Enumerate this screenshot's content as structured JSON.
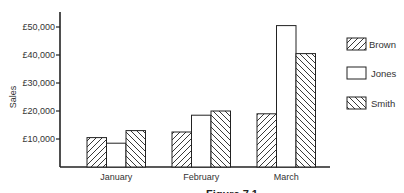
{
  "chart_data": {
    "type": "bar",
    "title": "",
    "xlabel": "",
    "ylabel": "Sales",
    "categories": [
      "January",
      "February",
      "March"
    ],
    "series": [
      {
        "name": "Brown",
        "pattern": "hatch-forward",
        "values": [
          10500,
          12500,
          19000
        ]
      },
      {
        "name": "Jones",
        "pattern": "plain",
        "values": [
          8500,
          18500,
          50500
        ]
      },
      {
        "name": "Smith",
        "pattern": "hatch-backward",
        "values": [
          13000,
          20000,
          40500
        ]
      }
    ],
    "yticks": [
      10000,
      20000,
      30000,
      40000,
      50000
    ],
    "ytick_labels": [
      "£10,000",
      "£20,000",
      "£30,000",
      "£40,000",
      "£50,000"
    ],
    "ylim": [
      0,
      55000
    ],
    "grid": false,
    "legend_position": "right",
    "caption": "Figure 7.1"
  },
  "colors": {
    "stroke": "#222222",
    "fill": "#ffffff",
    "text": "#333333"
  }
}
